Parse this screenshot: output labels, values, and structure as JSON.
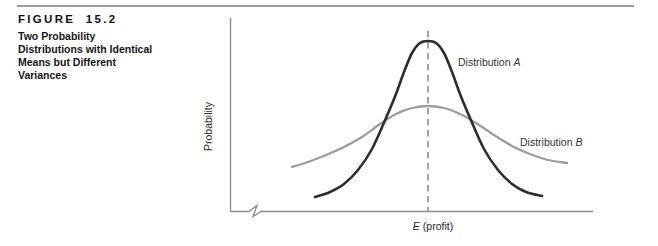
{
  "figure_header": {
    "label": "FIGURE 15.2",
    "caption": "Two Probability\nDistributions with Identical\nMeans but Different\nVariances"
  },
  "chart_data": {
    "type": "line",
    "title": "Two Probability Distributions with Identical Means but Different Variances",
    "xlabel": "E (profit)",
    "xlabel_parts": {
      "symbol": "E",
      "rest": "(profit)"
    },
    "ylabel": "Probability",
    "axes": {
      "numeric_ticks": false,
      "x_axis_break_near_origin": true,
      "axis_color": "#8f8f8f"
    },
    "mean_line": {
      "meaning": "common mean E(profit) shared by both distributions",
      "style": "dashed",
      "color": "#7d7d7d",
      "x_px": 428,
      "y1_px": 31,
      "y2_px": 211
    },
    "relationship": {
      "identical_means": true,
      "variance_relation": "variance of Distribution A < variance of Distribution B"
    },
    "series": [
      {
        "name": "Distribution A",
        "label_parts": {
          "prefix": "Distribution",
          "suffix": "A"
        },
        "shape": "tall narrow bell curve centered at E(profit)",
        "color": "#2d2d2d",
        "stroke_width": 2.6,
        "points_px": [
          [
            315,
            197
          ],
          [
            330,
            192
          ],
          [
            344,
            184
          ],
          [
            358,
            170
          ],
          [
            372,
            149
          ],
          [
            386,
            118
          ],
          [
            396,
            94
          ],
          [
            404,
            72
          ],
          [
            412,
            53
          ],
          [
            420,
            43
          ],
          [
            428,
            41
          ],
          [
            436,
            43
          ],
          [
            444,
            53
          ],
          [
            452,
            72
          ],
          [
            460,
            94
          ],
          [
            470,
            118
          ],
          [
            484,
            149
          ],
          [
            498,
            170
          ],
          [
            512,
            184
          ],
          [
            526,
            192
          ],
          [
            542,
            196
          ]
        ]
      },
      {
        "name": "Distribution B",
        "label_parts": {
          "prefix": "Distribution",
          "suffix": "B"
        },
        "shape": "short wide bell curve centered at E(profit)",
        "color": "#9d9d9d",
        "stroke_width": 2.3,
        "points_px": [
          [
            292,
            167
          ],
          [
            308,
            162
          ],
          [
            326,
            155
          ],
          [
            344,
            147
          ],
          [
            362,
            137
          ],
          [
            380,
            124
          ],
          [
            396,
            114
          ],
          [
            412,
            108
          ],
          [
            428,
            106
          ],
          [
            444,
            108
          ],
          [
            460,
            114
          ],
          [
            476,
            123
          ],
          [
            494,
            135
          ],
          [
            512,
            146
          ],
          [
            530,
            154
          ],
          [
            548,
            160
          ],
          [
            567,
            163
          ]
        ]
      }
    ]
  }
}
